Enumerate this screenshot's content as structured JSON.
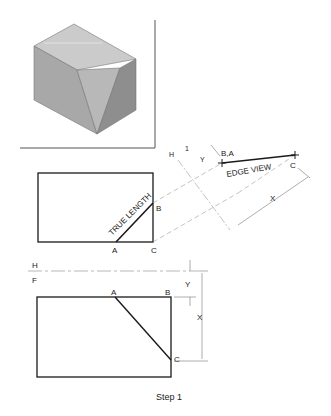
{
  "figure": {
    "caption": "Step 1",
    "pictorial": {
      "description": "isometric block with triangular cut"
    },
    "auxiliary_view": {
      "labels": {
        "ba": "B,A",
        "c": "C",
        "edge_view": "EDGE VIEW",
        "x": "X",
        "y": "Y",
        "h": "H",
        "one": "1"
      }
    },
    "top_view": {
      "labels": {
        "a": "A",
        "b": "B",
        "c": "C",
        "true_length": "TRUE LENGTH"
      }
    },
    "fold_line": {
      "upper": "H",
      "lower": "F"
    },
    "front_view": {
      "labels": {
        "a": "A",
        "b": "B",
        "c": "C",
        "x": "X",
        "y": "Y"
      }
    },
    "colors": {
      "line": "#1a1a1a",
      "construction": "#9a9a9a",
      "face_top": "#c9c9c9",
      "face_front": "#a9a9a9",
      "face_side": "#8c8c8c"
    }
  }
}
